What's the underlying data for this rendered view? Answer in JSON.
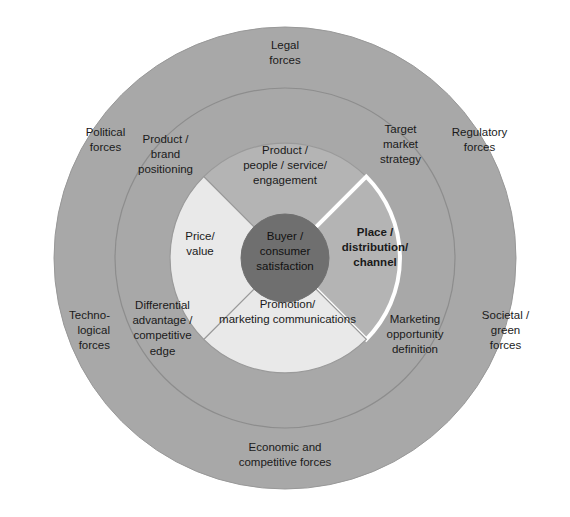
{
  "diagram": {
    "colors": {
      "background": "#ffffff",
      "outer_ring_fill": "#a8a8a8",
      "middle_ring_fill": "#a8a8a8",
      "ring_stroke": "#8f8f8f",
      "segment_dark_fill": "#b4b4b4",
      "segment_light_fill": "#e9e9e9",
      "segment_stroke": "#9a9a9a",
      "core_fill": "#6f6f6f",
      "highlight_stroke": "#ffffff",
      "text": "#1a1a1a"
    },
    "core": {
      "label": "Buyer /\nconsumer\nsatisfaction"
    },
    "inner_segments": [
      {
        "id": "product-people-service-engagement",
        "label": "Product /\npeople / service/\nengagement",
        "position": "top",
        "fill": "dark",
        "highlighted": false
      },
      {
        "id": "place-distribution-channel",
        "label": "Place /\ndistribution/\nchannel",
        "position": "right",
        "fill": "dark",
        "highlighted": true
      },
      {
        "id": "promotion-marketing-communications",
        "label": "Promotion/\nmarketing communications",
        "position": "bottom",
        "fill": "light",
        "highlighted": false
      },
      {
        "id": "price-value",
        "label": "Price/\nvalue",
        "position": "left",
        "fill": "light",
        "highlighted": false
      }
    ],
    "middle_ring_labels": [
      {
        "id": "product-brand-positioning",
        "label": "Product /\nbrand\npositioning",
        "position": "top-left"
      },
      {
        "id": "target-market-strategy",
        "label": "Target\nmarket\nstrategy",
        "position": "top-right"
      },
      {
        "id": "marketing-opportunity-definition",
        "label": "Marketing\nopportunity\ndefinition",
        "position": "bottom-right"
      },
      {
        "id": "differential-advantage-competitive-edge",
        "label": "Differential\nadvantage /\ncompetitive\nedge",
        "position": "bottom-left"
      }
    ],
    "outer_ring_labels": [
      {
        "id": "legal-forces",
        "label": "Legal\nforces",
        "position": "top"
      },
      {
        "id": "political-forces",
        "label": "Political\nforces",
        "position": "upper-left"
      },
      {
        "id": "regulatory-forces",
        "label": "Regulatory\nforces",
        "position": "upper-right"
      },
      {
        "id": "technological-forces",
        "label": "Techno-\nlogical\nforces",
        "position": "lower-left"
      },
      {
        "id": "societal-green-forces",
        "label": "Societal /\ngreen\nforces",
        "position": "lower-right"
      },
      {
        "id": "economic-and-competitive-forces",
        "label": "Economic and\ncompetitive forces",
        "position": "bottom"
      }
    ]
  }
}
